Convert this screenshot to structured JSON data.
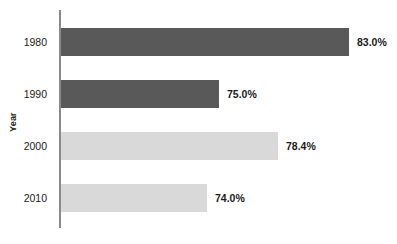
{
  "chart_data": {
    "type": "bar",
    "orientation": "horizontal",
    "title": "",
    "xlabel": "",
    "ylabel": "Year",
    "categories": [
      "1980",
      "1990",
      "2000",
      "2010"
    ],
    "values": [
      83.0,
      75.0,
      78.4,
      74.0
    ],
    "value_labels": [
      "83.0%",
      "75.0%",
      "78.4%",
      "74.0%"
    ],
    "bar_colors": [
      "#595959",
      "#595959",
      "#d9d9d9",
      "#d9d9d9"
    ],
    "bar_pixel_widths": [
      288,
      158,
      217,
      146
    ],
    "grid": false,
    "legend": false,
    "axis_line_color": "#8a8a8a",
    "background_color": "#ffffff",
    "text_color": "#1a1a1a"
  },
  "axis": {
    "y_title": "Year"
  },
  "bars": [
    {
      "category": "1980",
      "value_label": "83.0%"
    },
    {
      "category": "1990",
      "value_label": "75.0%"
    },
    {
      "category": "2000",
      "value_label": "78.4%"
    },
    {
      "category": "2010",
      "value_label": "74.0%"
    }
  ]
}
